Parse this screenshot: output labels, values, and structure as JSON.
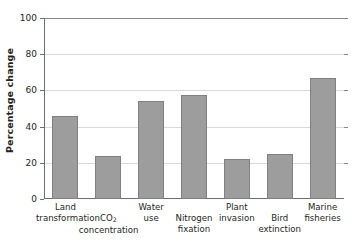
{
  "chart_data": {
    "type": "bar",
    "title": "",
    "xlabel": "",
    "ylabel": "Percentage change",
    "ylim": [
      0,
      100
    ],
    "ytick_values": [
      0,
      20,
      40,
      60,
      80,
      100
    ],
    "ytick_labels": [
      "0",
      "20",
      "40",
      "60",
      "80",
      "100"
    ],
    "grid": true,
    "legend": "none",
    "bar_color": "#9d9d9d",
    "bar_edge_color": "#808080",
    "categories": [
      "Land transformation",
      "CO2 concentration",
      "Water use",
      "Nitrogen fixation",
      "Plant invasion",
      "Bird extinction",
      "Marine fisheries"
    ],
    "values": [
      46,
      23.5,
      54,
      57.5,
      22,
      25,
      67
    ],
    "bars": [
      {
        "label": "Land transformation",
        "line1": "Land",
        "line2": "transformation",
        "line2_sub": "",
        "value": 46,
        "row": "high"
      },
      {
        "label": "CO2 concentration",
        "line1": "CO",
        "line1_sub": "2",
        "line2": "concentration",
        "value": 23.5,
        "row": "low"
      },
      {
        "label": "Water use",
        "line1": "Water",
        "line2": "use",
        "value": 54,
        "row": "high"
      },
      {
        "label": "Nitrogen fixation",
        "line1": "Nitrogen",
        "line2": "fixation",
        "value": 57.5,
        "row": "low"
      },
      {
        "label": "Plant invasion",
        "line1": "Plant",
        "line2": "invasion",
        "value": 22,
        "row": "high"
      },
      {
        "label": "Bird extinction",
        "line1": "Bird",
        "line2": "extinction",
        "value": 25,
        "row": "low"
      },
      {
        "label": "Marine fisheries",
        "line1": "Marine",
        "line2": "fisheries",
        "value": 67,
        "row": "high"
      }
    ]
  }
}
